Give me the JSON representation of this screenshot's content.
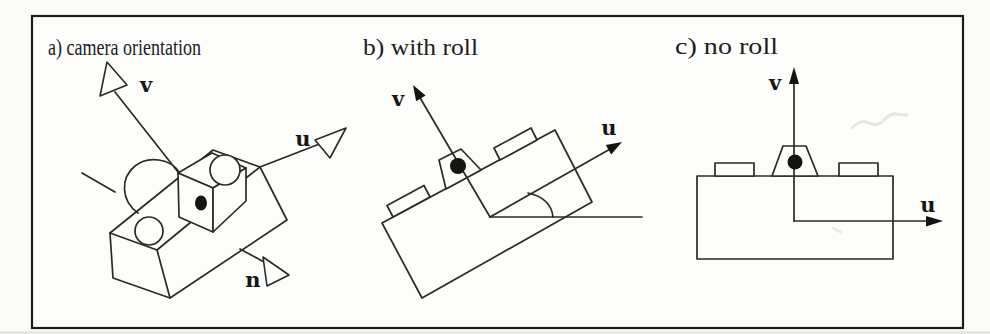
{
  "figure": {
    "colors": {
      "ink": "#2a2a27",
      "paper": "#fbfbf8",
      "frame": "#1c1c1a",
      "artifact": "#d9d9d1"
    },
    "panels": [
      {
        "key": "a",
        "title": "a) camera orientation",
        "axis_labels": {
          "v": "v",
          "u": "u",
          "n": "n"
        }
      },
      {
        "key": "b",
        "title": "b) with roll",
        "axis_labels": {
          "v": "v",
          "u": "u"
        }
      },
      {
        "key": "c",
        "title": "c) no roll",
        "axis_labels": {
          "v": "v",
          "u": "u"
        }
      }
    ]
  }
}
